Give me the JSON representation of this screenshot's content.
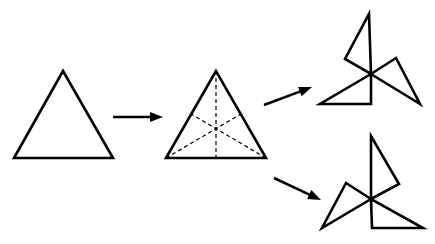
{
  "diagram": {
    "stroke_color": "#000000",
    "background_color": "#ffffff",
    "figures": [
      {
        "id": "original-triangle",
        "points": "63,71 14,158 113,158"
      },
      {
        "id": "divided-triangle",
        "points": "216,71 166,158 266,158",
        "medians": [
          {
            "x1": 216,
            "y1": 71,
            "x2": 216,
            "y2": 158
          },
          {
            "x1": 166,
            "y1": 158,
            "x2": 241,
            "y2": 114
          },
          {
            "x1": 266,
            "y1": 158,
            "x2": 191,
            "y2": 114
          }
        ]
      },
      {
        "id": "pinwheel-top",
        "pieces": [
          "371,74 369,14 345,59",
          "371,74 396,58 420,104",
          "371,74 320,104 371,104"
        ]
      },
      {
        "id": "pinwheel-bottom",
        "pieces": [
          "371,199 371,136 399,184",
          "371,199 346,183 322,228",
          "371,199 372,228 423,228"
        ]
      }
    ],
    "arrows": [
      {
        "id": "arrow-1",
        "x1": 113,
        "y1": 117,
        "x2": 163,
        "y2": 117
      },
      {
        "id": "arrow-2",
        "x1": 264,
        "y1": 105,
        "x2": 312,
        "y2": 87
      },
      {
        "id": "arrow-3",
        "x1": 274,
        "y1": 178,
        "x2": 321,
        "y2": 200
      }
    ]
  }
}
